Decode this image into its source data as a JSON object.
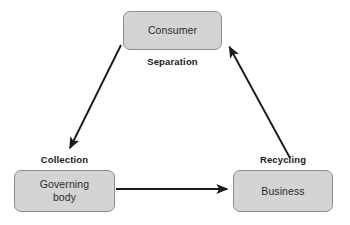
{
  "diagram": {
    "type": "cycle-flow-diagram",
    "background_color": "#ffffff",
    "node_fill_color": "#d4d4d4",
    "node_border_color": "#8c8c8c",
    "arrow_color": "#1a1a1a",
    "text_color": "#2b2b2b",
    "label_color": "#1a1a1a"
  },
  "nodes": [
    {
      "id": "consumer",
      "label": "Consumer",
      "position": "top-center"
    },
    {
      "id": "governing-body",
      "label": "Governing\nbody",
      "position": "bottom-left"
    },
    {
      "id": "business",
      "label": "Business",
      "position": "bottom-right"
    }
  ],
  "edges": [
    {
      "id": "consumer-to-governing",
      "label": "Separation",
      "from": "consumer",
      "to": "governing-body",
      "direction": "down-left"
    },
    {
      "id": "governing-to-business",
      "label": "Collection",
      "from": "governing-body",
      "to": "business",
      "direction": "right"
    },
    {
      "id": "business-to-consumer",
      "label": "Recycling",
      "from": "business",
      "to": "consumer",
      "direction": "up-left"
    }
  ]
}
